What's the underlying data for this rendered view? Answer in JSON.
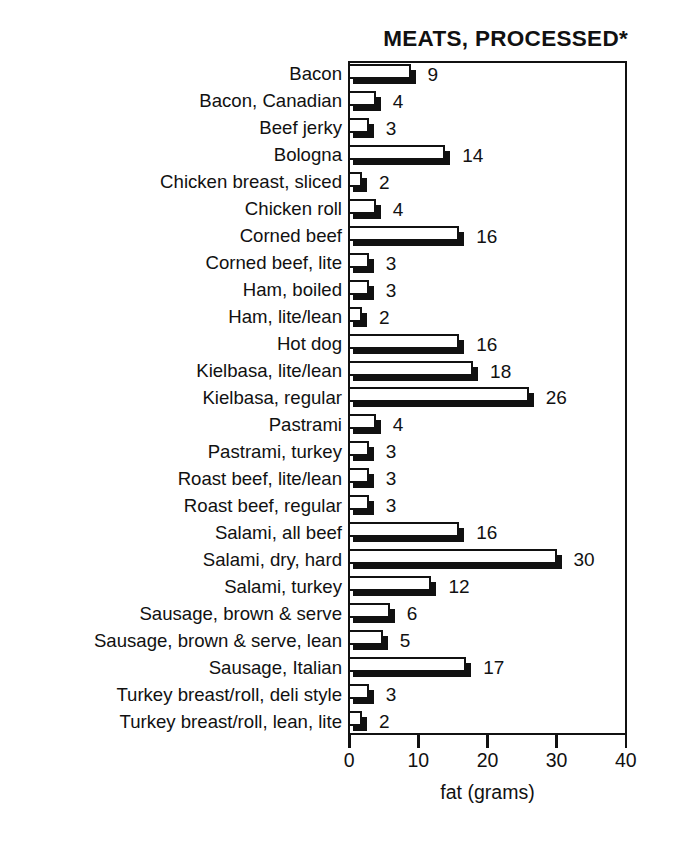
{
  "chart_data": {
    "type": "bar",
    "orientation": "horizontal",
    "title": "MEATS, PROCESSED*",
    "xlabel": "fat (grams)",
    "ylabel": "",
    "xlim": [
      0,
      40
    ],
    "xticks": [
      0,
      10,
      20,
      30,
      40
    ],
    "xtick_labels": [
      "0",
      "10",
      "20",
      "30",
      "40"
    ],
    "grid": false,
    "legend": null,
    "value_labels_shown": true,
    "categories": [
      "Bacon",
      "Bacon, Canadian",
      "Beef jerky",
      "Bologna",
      "Chicken breast, sliced",
      "Chicken roll",
      "Corned beef",
      "Corned beef, lite",
      "Ham, boiled",
      "Ham, lite/lean",
      "Hot dog",
      "Kielbasa, lite/lean",
      "Kielbasa, regular",
      "Pastrami",
      "Pastrami, turkey",
      "Roast beef, lite/lean",
      "Roast beef, regular",
      "Salami, all beef",
      "Salami, dry, hard",
      "Salami, turkey",
      "Sausage, brown & serve",
      "Sausage, brown & serve, lean",
      "Sausage, Italian",
      "Turkey breast/roll, deli style",
      "Turkey breast/roll, lean, lite"
    ],
    "values": [
      9,
      4,
      3,
      14,
      2,
      4,
      16,
      3,
      3,
      2,
      16,
      18,
      26,
      4,
      3,
      3,
      3,
      16,
      30,
      12,
      6,
      5,
      17,
      3,
      2
    ],
    "value_label_text": [
      "9",
      "4",
      "3",
      "14",
      "2",
      "4",
      "16",
      "3",
      "3",
      "2",
      "16",
      "18",
      "26",
      "4",
      "3",
      "3",
      "3",
      "16",
      "30",
      "12",
      "6",
      "5",
      "17",
      "3",
      "2"
    ]
  },
  "colors": {
    "bar_face": "#ffffff",
    "bar_outline": "#111111",
    "bar_shadow": "#111111",
    "frame": "#111111",
    "text": "#111111",
    "background": "#ffffff"
  }
}
